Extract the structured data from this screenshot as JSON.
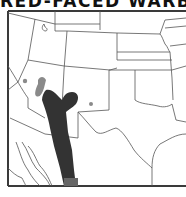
{
  "title": "RED-FACED WARBLER",
  "map": {
    "region": "Southwestern United States and northern Mexico",
    "colors": {
      "frame": "#3a3a3a",
      "borders": "#555555",
      "breeding_range": "#333333",
      "secondary_range": "#8a8a8a",
      "background": "#ffffff"
    },
    "ranges": [
      {
        "name": "primary-range",
        "shade": "dark"
      },
      {
        "name": "rare-range",
        "shade": "light"
      },
      {
        "name": "isolated-record-west",
        "shade": "light"
      },
      {
        "name": "isolated-record-east",
        "shade": "light"
      }
    ]
  }
}
